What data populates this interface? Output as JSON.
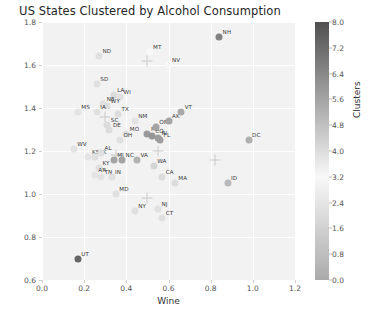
{
  "chart_data": {
    "type": "scatter",
    "title": "US States Clustered by Alcohol Consumption",
    "xlabel": "Wine",
    "ylabel": "Beer",
    "xlim": [
      0.0,
      1.2
    ],
    "ylim": [
      0.6,
      1.8
    ],
    "xticks": [
      "0.0",
      "0.2",
      "0.4",
      "0.6",
      "0.8",
      "1.0",
      "1.2"
    ],
    "yticks": [
      "0.6",
      "0.8",
      "1.0",
      "1.2",
      "1.4",
      "1.6",
      "1.8"
    ],
    "grid": true,
    "colorbar": {
      "label": "Clusters",
      "min": 0.0,
      "max": 8.0,
      "ticks": [
        "0.0",
        "0.8",
        "1.6",
        "2.4",
        "3.2",
        "4.0",
        "4.8",
        "5.6",
        "6.4",
        "7.2",
        "8.0"
      ],
      "colormap": "gray-diverging"
    },
    "points": [
      {
        "label": "NH",
        "x": 0.84,
        "y": 1.73,
        "cluster": 6.6
      },
      {
        "label": "ND",
        "x": 0.27,
        "y": 1.64,
        "cluster": 3.9
      },
      {
        "label": "MT",
        "x": 0.51,
        "y": 1.66,
        "cluster": 3.2
      },
      {
        "label": "NV",
        "x": 0.6,
        "y": 1.6,
        "cluster": 3.2
      },
      {
        "label": "SD",
        "x": 0.26,
        "y": 1.51,
        "cluster": 3.9
      },
      {
        "label": "LA",
        "x": 0.34,
        "y": 1.46,
        "cluster": 4.0
      },
      {
        "label": "WI",
        "x": 0.37,
        "y": 1.45,
        "cluster": 3.9
      },
      {
        "label": "NE",
        "x": 0.29,
        "y": 1.42,
        "cluster": 3.9
      },
      {
        "label": "WY",
        "x": 0.31,
        "y": 1.41,
        "cluster": 4.0
      },
      {
        "label": "MS",
        "x": 0.17,
        "y": 1.38,
        "cluster": 3.8
      },
      {
        "label": "IA",
        "x": 0.26,
        "y": 1.38,
        "cluster": 3.9
      },
      {
        "label": "TX",
        "x": 0.36,
        "y": 1.37,
        "cluster": 4.0
      },
      {
        "label": "NM",
        "x": 0.44,
        "y": 1.34,
        "cluster": 3.8
      },
      {
        "label": "SC",
        "x": 0.31,
        "y": 1.32,
        "cluster": 4.0
      },
      {
        "label": "DE",
        "x": 0.32,
        "y": 1.3,
        "cluster": 4.0
      },
      {
        "label": "MO",
        "x": 0.4,
        "y": 1.28,
        "cluster": 3.9
      },
      {
        "label": "OH",
        "x": 0.37,
        "y": 1.25,
        "cluster": 3.9
      },
      {
        "label": "WV",
        "x": 0.15,
        "y": 1.21,
        "cluster": 3.8
      },
      {
        "label": "KS",
        "x": 0.22,
        "y": 1.17,
        "cluster": 3.8
      },
      {
        "label": "OK",
        "x": 0.25,
        "y": 1.17,
        "cluster": 3.9
      },
      {
        "label": "AL",
        "x": 0.28,
        "y": 1.19,
        "cluster": 3.9
      },
      {
        "label": "KY",
        "x": 0.27,
        "y": 1.12,
        "cluster": 3.9
      },
      {
        "label": "AR",
        "x": 0.25,
        "y": 1.09,
        "cluster": 3.8
      },
      {
        "label": "TN",
        "x": 0.28,
        "y": 1.08,
        "cluster": 3.8
      },
      {
        "label": "IN",
        "x": 0.33,
        "y": 1.08,
        "cluster": 3.9
      },
      {
        "label": "MI",
        "x": 0.34,
        "y": 1.16,
        "cluster": 5.6
      },
      {
        "label": "NC",
        "x": 0.38,
        "y": 1.16,
        "cluster": 5.6
      },
      {
        "label": "VA",
        "x": 0.45,
        "y": 1.16,
        "cluster": 5.2
      },
      {
        "label": "ME",
        "x": 0.5,
        "y": 1.28,
        "cluster": 5.9
      },
      {
        "label": "CO",
        "x": 0.52,
        "y": 1.27,
        "cluster": 6.0
      },
      {
        "label": "RI",
        "x": 0.55,
        "y": 1.26,
        "cluster": 5.8
      },
      {
        "label": "FL",
        "x": 0.56,
        "y": 1.25,
        "cluster": 5.8
      },
      {
        "label": "OR",
        "x": 0.54,
        "y": 1.31,
        "cluster": 5.6
      },
      {
        "label": "AK",
        "x": 0.6,
        "y": 1.34,
        "cluster": 5.6
      },
      {
        "label": "VT",
        "x": 0.66,
        "y": 1.38,
        "cluster": 5.5
      },
      {
        "label": "WA",
        "x": 0.53,
        "y": 1.13,
        "cluster": 4.2
      },
      {
        "label": "CA",
        "x": 0.57,
        "y": 1.08,
        "cluster": 4.0
      },
      {
        "label": "MA",
        "x": 0.63,
        "y": 1.05,
        "cluster": 4.0
      },
      {
        "label": "MD",
        "x": 0.35,
        "y": 1.0,
        "cluster": 3.9
      },
      {
        "label": "NY",
        "x": 0.44,
        "y": 0.92,
        "cluster": 3.9
      },
      {
        "label": "NJ",
        "x": 0.55,
        "y": 0.93,
        "cluster": 3.9
      },
      {
        "label": "CT",
        "x": 0.57,
        "y": 0.89,
        "cluster": 3.9
      },
      {
        "label": "DC",
        "x": 0.98,
        "y": 1.25,
        "cluster": 5.3
      },
      {
        "label": "ID",
        "x": 0.88,
        "y": 1.05,
        "cluster": 5.0
      },
      {
        "label": "UT",
        "x": 0.17,
        "y": 0.7,
        "cluster": 7.4
      }
    ],
    "crosshair_markers": [
      {
        "x": 0.5,
        "y": 1.62
      },
      {
        "x": 0.3,
        "y": 1.36
      },
      {
        "x": 0.35,
        "y": 1.18
      },
      {
        "x": 0.55,
        "y": 1.2
      },
      {
        "x": 0.82,
        "y": 1.16
      },
      {
        "x": 0.5,
        "y": 0.98
      }
    ]
  }
}
